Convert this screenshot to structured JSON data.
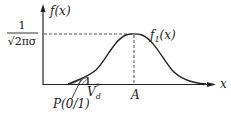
{
  "diagram": {
    "type": "normal-distribution-curve",
    "y_axis_label": "f(x)",
    "x_axis_label": "x",
    "peak_value_label": {
      "numerator": "1",
      "denominator": "√2πσ"
    },
    "curve_label": {
      "base": "f",
      "subscript": "1",
      "arg": "(x)"
    },
    "mean_label": "A",
    "threshold_label": {
      "base": "V",
      "subscript": "d",
      "superscript": "*"
    },
    "shaded_area_label": "P(0/1)",
    "colors": {
      "line": "#222222",
      "dashed": "#555555",
      "background": "#ffffff"
    }
  }
}
